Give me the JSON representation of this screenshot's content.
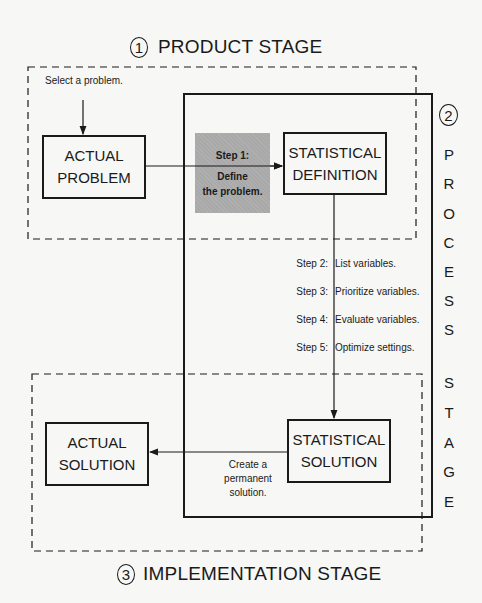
{
  "product_stage": {
    "number": "1",
    "title": "PRODUCT STAGE",
    "note": "Select a problem."
  },
  "process_stage": {
    "number": "2",
    "letters": [
      "P",
      "R",
      "O",
      "C",
      "E",
      "S",
      "S",
      "S",
      "T",
      "A",
      "G",
      "E"
    ],
    "title": "PROCESS STAGE"
  },
  "implementation_stage": {
    "number": "3",
    "title": "IMPLEMENTATION STAGE"
  },
  "boxes": {
    "actual_problem": [
      "ACTUAL",
      "PROBLEM"
    ],
    "statistical_definition": [
      "STATISTICAL",
      "DEFINITION"
    ],
    "statistical_solution": [
      "STATISTICAL",
      "SOLUTION"
    ],
    "actual_solution": [
      "ACTUAL",
      "SOLUTION"
    ]
  },
  "step1": {
    "label": "Step 1:",
    "line1": "Define",
    "line2": "the problem."
  },
  "steps": [
    {
      "label": "Step 2:",
      "text": "List variables."
    },
    {
      "label": "Step 3:",
      "text": "Prioritize variables."
    },
    {
      "label": "Step 4:",
      "text": "Evaluate variables."
    },
    {
      "label": "Step 5:",
      "text": "Optimize settings."
    }
  ],
  "permanent": {
    "line1": "Create a",
    "line2": "permanent",
    "line3": "solution."
  },
  "colors": {
    "ink": "#1a1a1a",
    "step1_fill": "#a9a9a9",
    "background": "#f7f7f5"
  }
}
